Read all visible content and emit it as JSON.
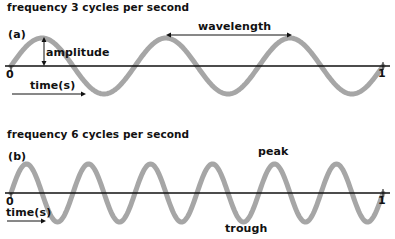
{
  "panel_a": {
    "title": "frequency 3 cycles per second",
    "tag": "(a)",
    "cycles": 3,
    "labels": {
      "amplitude": "amplitude",
      "wavelength": "wavelength",
      "time": "time(s)",
      "start": "0",
      "end": "1"
    }
  },
  "panel_b": {
    "title": "frequency 6 cycles per second",
    "tag": "(b)",
    "cycles": 6,
    "labels": {
      "peak": "peak",
      "trough": "trough",
      "time": "time(s)",
      "start": "0",
      "end": "1"
    }
  },
  "colors": {
    "wave": "#a6a6a6",
    "axis": "#111111",
    "text": "#111111"
  }
}
